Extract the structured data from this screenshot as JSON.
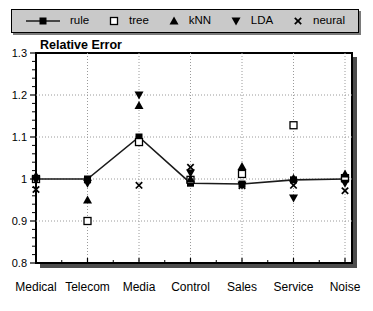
{
  "colors": {
    "marker": "#000000",
    "line": "#1a1a1a",
    "grid": "#9a9a9a",
    "plot_border": "#000000",
    "plot_shadow": "#4d4d4d",
    "legend_bg": "#c9c9c9",
    "legend_shadow": "#7a7a7a",
    "text": "#000000"
  },
  "chart_data": {
    "type": "scatter",
    "title": "Relative Error",
    "xlabel": "",
    "ylabel": "",
    "ylim": [
      0.8,
      1.3
    ],
    "ytick_labels": [
      "0.8",
      "0.9",
      "1",
      "1.1",
      "1.2",
      "1.3"
    ],
    "yticks": [
      0.8,
      0.9,
      1.0,
      1.1,
      1.2,
      1.3
    ],
    "grid": true,
    "legend_position": "top",
    "categories": [
      "Medical",
      "Telecom",
      "Media",
      "Control",
      "Sales",
      "Service",
      "Noise"
    ],
    "series": [
      {
        "name": "rule",
        "marker": "filled-square",
        "line": true,
        "values": [
          1.0,
          1.0,
          1.1,
          0.99,
          0.988,
          0.998,
          1.0
        ]
      },
      {
        "name": "tree",
        "marker": "open-square",
        "line": false,
        "values": [
          1.0,
          0.9,
          1.088,
          0.998,
          1.012,
          1.128,
          1.002
        ]
      },
      {
        "name": "kNN",
        "marker": "filled-triangle-up",
        "line": false,
        "values": [
          1.008,
          0.95,
          1.175,
          1.0,
          1.03,
          1.002,
          1.012
        ]
      },
      {
        "name": "LDA",
        "marker": "filled-triangle-down",
        "line": false,
        "values": [
          0.997,
          0.99,
          1.2,
          1.014,
          0.985,
          0.955,
          0.99
        ]
      },
      {
        "name": "neural",
        "marker": "x-cross",
        "line": false,
        "values": [
          0.975,
          0.998,
          0.985,
          1.028,
          0.984,
          0.985,
          0.972
        ]
      }
    ]
  }
}
